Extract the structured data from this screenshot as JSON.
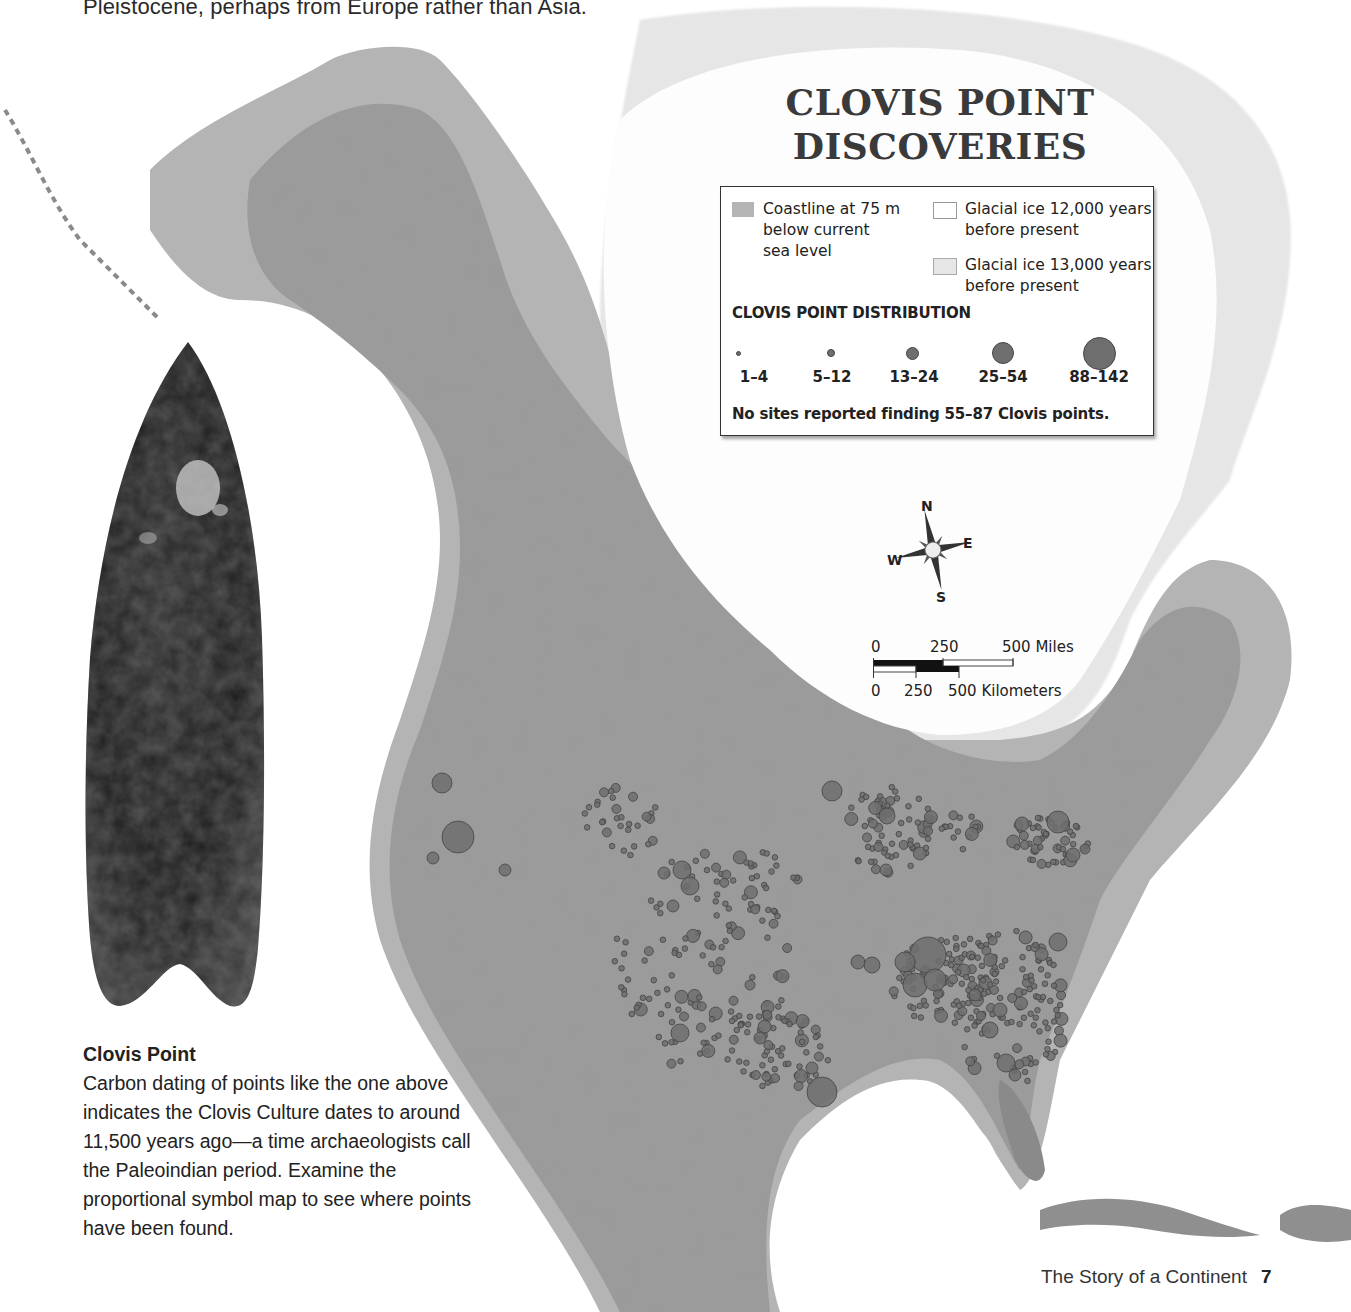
{
  "page": {
    "intro_text": "Pleistocene, perhaps from Europe rather than Asia.",
    "footer_title": "The Story of a Continent",
    "page_number": "7"
  },
  "map": {
    "title_line1": "CLOVIS POINT",
    "title_line2": "DISCOVERIES",
    "colors": {
      "coastline_75m": "#b4b4b4",
      "land_relief": "#9a9a9a",
      "glacial_ice_12000": "#ffffff",
      "glacial_ice_13000": "#e6e6e6",
      "clovis_dot": "#6e6e6e",
      "clovis_dot_outline": "#444444"
    },
    "legend": {
      "items": [
        {
          "swatch": "coastline",
          "label_lines": [
            "Coastline at 75 m",
            "below current",
            "sea level"
          ]
        },
        {
          "swatch": "ice12000",
          "label_lines": [
            "Glacial ice 12,000 years",
            "before present"
          ]
        },
        {
          "swatch": "ice13000",
          "label_lines": [
            "Glacial ice 13,000 years",
            "before present"
          ]
        }
      ],
      "distribution_header": "CLOVIS POINT DISTRIBUTION",
      "distribution": [
        {
          "range": "1–4",
          "size": 4
        },
        {
          "range": "5–12",
          "size": 7
        },
        {
          "range": "13–24",
          "size": 12
        },
        {
          "range": "25–54",
          "size": 20
        },
        {
          "range": "88–142",
          "size": 31
        }
      ],
      "note": "No sites reported finding 55–87 Clovis points."
    },
    "compass": {
      "n": "N",
      "e": "E",
      "s": "S",
      "w": "W"
    },
    "scale": {
      "miles_labels": [
        "0",
        "250",
        "500 Miles"
      ],
      "km_labels": [
        "0",
        "250",
        "500 Kilometers"
      ]
    }
  },
  "caption": {
    "title": "Clovis Point",
    "body": "Carbon dating of points like the one above indicates the Clovis Culture dates to around 11,500 years ago—a time archaeologists call the Paleoindian period. Examine the proportional symbol map to see where points have been found."
  },
  "chart_data": {
    "type": "map",
    "title": "CLOVIS POINT DISCOVERIES",
    "legend": [
      "Coastline at 75 m below current sea level",
      "Glacial ice 12,000 years before present",
      "Glacial ice 13,000 years before present"
    ],
    "symbol_classes": [
      "1–4",
      "5–12",
      "13–24",
      "25–54",
      "88–142"
    ],
    "note": "No sites reported finding 55–87 Clovis points.",
    "scale": {
      "miles": [
        0,
        250,
        500
      ],
      "kilometers": [
        0,
        250,
        500
      ]
    },
    "sites": [
      {
        "x": 442,
        "y": 783,
        "r": 10
      },
      {
        "x": 458,
        "y": 837,
        "r": 16
      },
      {
        "x": 433,
        "y": 858,
        "r": 6
      },
      {
        "x": 505,
        "y": 870,
        "r": 6
      },
      {
        "x": 832,
        "y": 791,
        "r": 10
      },
      {
        "x": 682,
        "y": 870,
        "r": 9
      },
      {
        "x": 690,
        "y": 886,
        "r": 9
      },
      {
        "x": 664,
        "y": 873,
        "r": 6
      },
      {
        "x": 673,
        "y": 906,
        "r": 6
      },
      {
        "x": 822,
        "y": 1092,
        "r": 15
      },
      {
        "x": 680,
        "y": 1033,
        "r": 9
      },
      {
        "x": 750,
        "y": 985,
        "r": 5
      },
      {
        "x": 1058,
        "y": 822,
        "r": 11
      },
      {
        "x": 1022,
        "y": 824,
        "r": 7
      },
      {
        "x": 1073,
        "y": 855,
        "r": 7
      },
      {
        "x": 1085,
        "y": 849,
        "r": 5
      },
      {
        "x": 887,
        "y": 816,
        "r": 8
      },
      {
        "x": 886,
        "y": 870,
        "r": 6
      },
      {
        "x": 858,
        "y": 962,
        "r": 7
      },
      {
        "x": 928,
        "y": 955,
        "r": 18
      },
      {
        "x": 915,
        "y": 985,
        "r": 12
      },
      {
        "x": 905,
        "y": 962,
        "r": 10
      },
      {
        "x": 935,
        "y": 980,
        "r": 11
      },
      {
        "x": 872,
        "y": 965,
        "r": 8
      },
      {
        "x": 1058,
        "y": 942,
        "r": 9
      },
      {
        "x": 1006,
        "y": 1063,
        "r": 9
      },
      {
        "x": 1015,
        "y": 1075,
        "r": 6
      },
      {
        "x": 812,
        "y": 1068,
        "r": 6
      },
      {
        "x": 760,
        "y": 1038,
        "r": 6
      },
      {
        "x": 990,
        "y": 1030,
        "r": 8
      },
      {
        "x": 1000,
        "y": 1010,
        "r": 7
      },
      {
        "x": 975,
        "y": 995,
        "r": 6
      }
    ]
  }
}
